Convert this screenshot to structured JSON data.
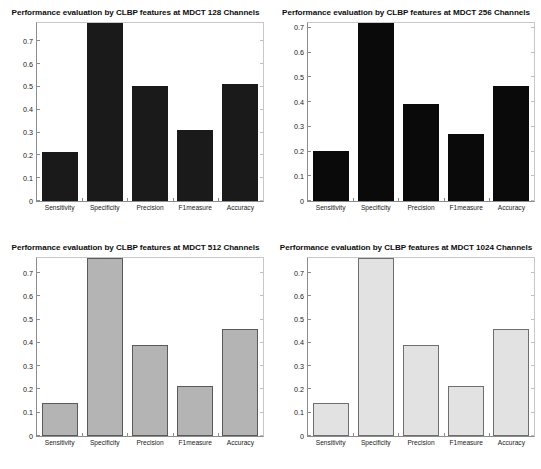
{
  "figure": {
    "background": "#ffffff",
    "width": 541,
    "height": 469
  },
  "chart_data": [
    {
      "id": "mdct-128",
      "type": "bar",
      "title": "Performance evaluation by CLBP features at MDCT 128 Channels",
      "xlabel": "",
      "ylabel": "",
      "categories": [
        "Sensitivity",
        "Specificity",
        "Precision",
        "F1measure",
        "Accuracy"
      ],
      "values": [
        0.215,
        0.78,
        0.505,
        0.31,
        0.512
      ],
      "ylim": [
        0,
        0.78
      ],
      "yticks": [
        0,
        0.1,
        0.2,
        0.3,
        0.4,
        0.5,
        0.6,
        0.7
      ],
      "yticklabels": [
        "0",
        "0.1",
        "0.2",
        "0.3",
        "0.4",
        "0.5",
        "0.6",
        "0.7"
      ],
      "bar_fill": "#1a1a1a",
      "bar_edge": "#1a1a1a",
      "grid": false,
      "legend": null
    },
    {
      "id": "mdct-256",
      "type": "bar",
      "title": "Performance evaluation by CLBP features at MDCT 256 Channels",
      "xlabel": "",
      "ylabel": "",
      "categories": [
        "Sensitivity",
        "Specificity",
        "Precision",
        "F1measure",
        "Accuracy"
      ],
      "values": [
        0.203,
        0.72,
        0.392,
        0.272,
        0.465
      ],
      "ylim": [
        0,
        0.72
      ],
      "yticks": [
        0,
        0.1,
        0.2,
        0.3,
        0.4,
        0.5,
        0.6,
        0.7
      ],
      "yticklabels": [
        "0",
        "0.1",
        "0.2",
        "0.3",
        "0.4",
        "0.5",
        "0.6",
        "0.7"
      ],
      "bar_fill": "#0a0a0a",
      "bar_edge": "#0a0a0a",
      "grid": false,
      "legend": null
    },
    {
      "id": "mdct-512",
      "type": "bar",
      "title": "Performance evaluation by CLBP features at MDCT 512 Channels",
      "xlabel": "",
      "ylabel": "",
      "categories": [
        "Sensitivity",
        "Specificity",
        "Precision",
        "F1measure",
        "Accuracy"
      ],
      "values": [
        0.143,
        0.765,
        0.39,
        0.215,
        0.458
      ],
      "ylim": [
        0,
        0.765
      ],
      "yticks": [
        0,
        0.1,
        0.2,
        0.3,
        0.4,
        0.5,
        0.6,
        0.7
      ],
      "yticklabels": [
        "0",
        "0.1",
        "0.2",
        "0.3",
        "0.4",
        "0.5",
        "0.6",
        "0.7"
      ],
      "bar_fill": "#b4b4b4",
      "bar_edge": "#5a5a5a",
      "grid": false,
      "legend": null
    },
    {
      "id": "mdct-1024",
      "type": "bar",
      "title": "Performance evaluation by CLBP features at MDCT 1024 Channels",
      "xlabel": "",
      "ylabel": "",
      "categories": [
        "Sensitivity",
        "Specificity",
        "Precision",
        "F1measure",
        "Accuracy"
      ],
      "values": [
        0.142,
        0.765,
        0.391,
        0.216,
        0.459
      ],
      "ylim": [
        0,
        0.765
      ],
      "yticks": [
        0,
        0.1,
        0.2,
        0.3,
        0.4,
        0.5,
        0.6,
        0.7
      ],
      "yticklabels": [
        "0",
        "0.1",
        "0.2",
        "0.3",
        "0.4",
        "0.5",
        "0.6",
        "0.7"
      ],
      "bar_fill": "#e2e2e2",
      "bar_edge": "#6e6e6e",
      "grid": false,
      "legend": null
    }
  ]
}
